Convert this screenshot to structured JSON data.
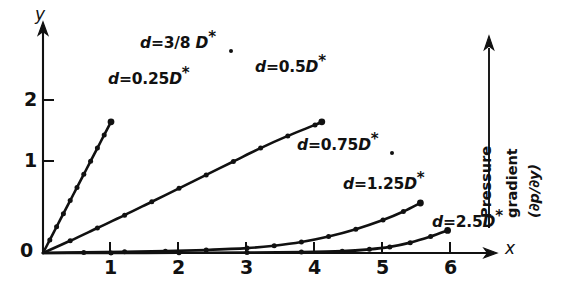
{
  "figure": {
    "background_color": "#ffffff",
    "ink_color": "#111111",
    "axis_labels": {
      "x": "x",
      "y": "y",
      "origin": "0"
    },
    "x_ticks": [
      "1",
      "2",
      "3",
      "4",
      "5",
      "6"
    ],
    "y_ticks": [
      "1",
      "2"
    ],
    "annotation": {
      "name": "pressure-gradient",
      "line1": "Pressure",
      "line2": "gradient",
      "line3": "(∂p/∂y)",
      "arrow_direction": "up"
    },
    "curve_labels": [
      {
        "id": "d-0p25",
        "prefix": "d",
        "eq": "=",
        "value": "0.25",
        "symbol": "D",
        "star": "*",
        "full": "d = 0.25D*"
      },
      {
        "id": "d-3over8",
        "prefix": "d",
        "eq": "=",
        "value": "3/8",
        "symbol": "D",
        "star": "*",
        "full": "d = 3/8 D*"
      },
      {
        "id": "d-0p5",
        "prefix": "d",
        "eq": "=",
        "value": "0.5",
        "symbol": "D",
        "star": "*",
        "full": "d = 0.5D*"
      },
      {
        "id": "d-0p75",
        "prefix": "d",
        "eq": "=",
        "value": "0.75",
        "symbol": "D",
        "star": "*",
        "full": "d = 0.75D*"
      },
      {
        "id": "d-1p25",
        "prefix": "d",
        "eq": "=",
        "value": "1.25",
        "symbol": "D",
        "star": "*",
        "full": "d = 1.25D*"
      },
      {
        "id": "d-2p5",
        "prefix": "d",
        "eq": "=",
        "value": "2.5",
        "symbol": "D",
        "star": "*",
        "full": "d = 2.5D*"
      }
    ]
  },
  "chart_data": {
    "type": "line",
    "title": "",
    "subtitle": "",
    "xlabel": "x",
    "ylabel": "y",
    "xlim": [
      0,
      6.6
    ],
    "ylim": [
      0,
      2.6
    ],
    "xticks": [
      1,
      2,
      3,
      4,
      5,
      6
    ],
    "yticks": [
      0,
      1,
      2
    ],
    "grid": false,
    "legend": "inline-curve-labels",
    "markers": "filled-circle",
    "annotations": [
      {
        "text": "Pressure gradient (∂p/∂y)",
        "type": "vertical-arrow-label",
        "position": "right",
        "direction": "increasing-upward"
      }
    ],
    "series": [
      {
        "name": "d = 0.25D*",
        "label": "d = 0.25D*",
        "x": [
          0,
          0.1,
          0.2,
          0.3,
          0.4,
          0.5,
          0.6,
          0.7,
          0.8,
          0.9,
          1.0
        ],
        "y": [
          0,
          0.215,
          0.43,
          0.645,
          0.86,
          1.075,
          1.29,
          1.505,
          1.72,
          1.935,
          2.15
        ]
      },
      {
        "name": "d = 3/8 D*",
        "label": "d = 3/8 D*",
        "x": [],
        "y": [],
        "note": "label only; leader dot points to the 0.25D* / 0.5D* cluster"
      },
      {
        "name": "d = 0.5D*",
        "label": "d = 0.5D*",
        "x": [
          0,
          0.4,
          0.8,
          1.2,
          1.6,
          2.0,
          2.4,
          2.8,
          3.2,
          3.6,
          4.0,
          4.1
        ],
        "y": [
          0,
          0.2,
          0.41,
          0.62,
          0.84,
          1.06,
          1.28,
          1.5,
          1.72,
          1.92,
          2.1,
          2.15
        ]
      },
      {
        "name": "d = 0.75D*",
        "label": "d = 0.75D*",
        "x": [],
        "y": [],
        "note": "label only; leader dot points toward the 0.5D* curve end"
      },
      {
        "name": "d = 1.25D*",
        "label": "d = 1.25D*",
        "x": [
          0,
          0.6,
          1.2,
          1.8,
          2.4,
          3.0,
          3.4,
          3.8,
          4.2,
          4.6,
          5.0,
          5.3,
          5.55
        ],
        "y": [
          0,
          0.01,
          0.02,
          0.03,
          0.05,
          0.08,
          0.12,
          0.18,
          0.27,
          0.39,
          0.54,
          0.68,
          0.82
        ]
      },
      {
        "name": "d = 2.5D*",
        "label": "d = 2.5D*",
        "x": [
          0,
          1.0,
          2.0,
          3.0,
          3.8,
          4.4,
          4.8,
          5.1,
          5.4,
          5.7,
          5.95
        ],
        "y": [
          0,
          0.002,
          0.004,
          0.008,
          0.015,
          0.03,
          0.06,
          0.1,
          0.17,
          0.27,
          0.37
        ]
      }
    ]
  }
}
